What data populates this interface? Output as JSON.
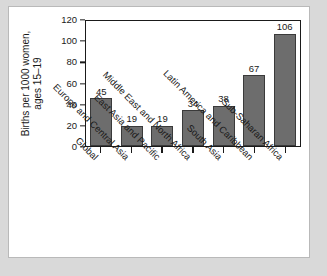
{
  "chart_data": {
    "type": "bar",
    "title": "",
    "xlabel": "",
    "ylabel": "Births per 1000 women, ages 15–19",
    "ylabel_line1": "Births per 1000 women,",
    "ylabel_line2": "ages 15–19",
    "ylim": [
      0,
      120
    ],
    "ytick_values": [
      0,
      20,
      40,
      60,
      80,
      100,
      120
    ],
    "ytick_labels": [
      "0",
      "20",
      "40",
      "60",
      "80",
      "100",
      "120"
    ],
    "grid": false,
    "legend": false,
    "bar_color": "#6d6d6d",
    "bar_edge_color": "#3a3a3a",
    "axis_color": "#1a1a1a",
    "categories": [
      "Global",
      "Europe and Central Asia",
      "East Asia and Pacific",
      "Middle East and North Africa",
      "South Asia",
      "Latin America and Caribbean",
      "Sub-Saharan Africa"
    ],
    "values": [
      45,
      19,
      19,
      34,
      38,
      67,
      106
    ],
    "value_labels": [
      "45",
      "19",
      "19",
      "34",
      "38",
      "67",
      "106"
    ]
  },
  "page": {
    "background_color": "#d9d9d9",
    "card_color": "#ffffff",
    "card_border_color": "#b9b9b9"
  }
}
